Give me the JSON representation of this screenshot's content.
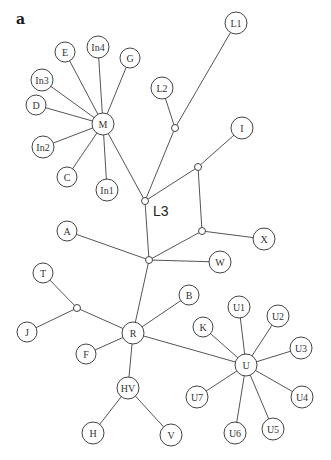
{
  "figure": {
    "panel_label": "a",
    "colors": {
      "edge": "#555555",
      "node_stroke": "#444444",
      "node_fill": "#ffffff",
      "text": "#333333"
    }
  },
  "nodes": [
    {
      "id": "M",
      "label": "M",
      "x": 103,
      "y": 124,
      "r": 11
    },
    {
      "id": "E",
      "label": "E",
      "x": 65,
      "y": 52,
      "r": 10
    },
    {
      "id": "In4",
      "label": "In4",
      "x": 98,
      "y": 47,
      "r": 11
    },
    {
      "id": "G",
      "label": "G",
      "x": 130,
      "y": 58,
      "r": 10
    },
    {
      "id": "In3",
      "label": "In3",
      "x": 42,
      "y": 80,
      "r": 11
    },
    {
      "id": "D",
      "label": "D",
      "x": 36,
      "y": 105,
      "r": 10
    },
    {
      "id": "In2",
      "label": "In2",
      "x": 43,
      "y": 147,
      "r": 11
    },
    {
      "id": "C",
      "label": "C",
      "x": 67,
      "y": 177,
      "r": 10
    },
    {
      "id": "In1",
      "label": "In1",
      "x": 107,
      "y": 190,
      "r": 11
    },
    {
      "id": "L1",
      "label": "L1",
      "x": 236,
      "y": 23,
      "r": 11
    },
    {
      "id": "L2",
      "label": "L2",
      "x": 162,
      "y": 88,
      "r": 11
    },
    {
      "id": "I",
      "label": "I",
      "x": 242,
      "y": 128,
      "r": 11
    },
    {
      "id": "A",
      "label": "A",
      "x": 67,
      "y": 231,
      "r": 10
    },
    {
      "id": "X",
      "label": "X",
      "x": 264,
      "y": 239,
      "r": 11
    },
    {
      "id": "W",
      "label": "W",
      "x": 220,
      "y": 262,
      "r": 11
    },
    {
      "id": "T",
      "label": "T",
      "x": 43,
      "y": 273,
      "r": 10
    },
    {
      "id": "B",
      "label": "B",
      "x": 189,
      "y": 295,
      "r": 10
    },
    {
      "id": "J",
      "label": "J",
      "x": 27,
      "y": 332,
      "r": 10
    },
    {
      "id": "R",
      "label": "R",
      "x": 133,
      "y": 333,
      "r": 11
    },
    {
      "id": "F",
      "label": "F",
      "x": 86,
      "y": 354,
      "r": 10
    },
    {
      "id": "HV",
      "label": "HV",
      "x": 128,
      "y": 388,
      "r": 11
    },
    {
      "id": "H",
      "label": "H",
      "x": 93,
      "y": 433,
      "r": 11
    },
    {
      "id": "V",
      "label": "V",
      "x": 171,
      "y": 435,
      "r": 11
    },
    {
      "id": "K",
      "label": "K",
      "x": 203,
      "y": 327,
      "r": 10
    },
    {
      "id": "U",
      "label": "U",
      "x": 246,
      "y": 365,
      "r": 11
    },
    {
      "id": "U1",
      "label": "U1",
      "x": 239,
      "y": 307,
      "r": 11
    },
    {
      "id": "U2",
      "label": "U2",
      "x": 278,
      "y": 316,
      "r": 11
    },
    {
      "id": "U3",
      "label": "U3",
      "x": 301,
      "y": 348,
      "r": 11
    },
    {
      "id": "U4",
      "label": "U4",
      "x": 302,
      "y": 397,
      "r": 11
    },
    {
      "id": "U5",
      "label": "U5",
      "x": 273,
      "y": 429,
      "r": 11
    },
    {
      "id": "U6",
      "label": "U6",
      "x": 235,
      "y": 433,
      "r": 11
    },
    {
      "id": "U7",
      "label": "U7",
      "x": 197,
      "y": 397,
      "r": 11
    }
  ],
  "junctions": [
    {
      "id": "jL2",
      "x": 175,
      "y": 128,
      "r": 3.5
    },
    {
      "id": "jL3",
      "x": 145,
      "y": 201,
      "r": 3.5,
      "label": "L3",
      "label_x": 153,
      "label_y": 216
    },
    {
      "id": "jI",
      "x": 198,
      "y": 167,
      "r": 3.5
    },
    {
      "id": "jX",
      "x": 202,
      "y": 231,
      "r": 3.5
    },
    {
      "id": "jC",
      "x": 149,
      "y": 260,
      "r": 3.5
    },
    {
      "id": "jT",
      "x": 77,
      "y": 308,
      "r": 3.5
    }
  ],
  "edges": [
    [
      "M",
      "E"
    ],
    [
      "M",
      "In4"
    ],
    [
      "M",
      "G"
    ],
    [
      "M",
      "In3"
    ],
    [
      "M",
      "D"
    ],
    [
      "M",
      "In2"
    ],
    [
      "M",
      "C"
    ],
    [
      "M",
      "In1"
    ],
    [
      "M",
      "jL3"
    ],
    [
      "L1",
      "jL2"
    ],
    [
      "L2",
      "jL2"
    ],
    [
      "jL2",
      "jL3"
    ],
    [
      "jL3",
      "jI"
    ],
    [
      "jI",
      "I"
    ],
    [
      "jI",
      "jX"
    ],
    [
      "jX",
      "X"
    ],
    [
      "jX",
      "jC"
    ],
    [
      "jL3",
      "jC"
    ],
    [
      "A",
      "jC"
    ],
    [
      "W",
      "jC"
    ],
    [
      "jC",
      "R"
    ],
    [
      "T",
      "jT"
    ],
    [
      "J",
      "jT"
    ],
    [
      "jT",
      "R"
    ],
    [
      "R",
      "B"
    ],
    [
      "R",
      "F"
    ],
    [
      "R",
      "HV"
    ],
    [
      "R",
      "U"
    ],
    [
      "HV",
      "H"
    ],
    [
      "HV",
      "V"
    ],
    [
      "U",
      "K"
    ],
    [
      "U",
      "U1"
    ],
    [
      "U",
      "U2"
    ],
    [
      "U",
      "U3"
    ],
    [
      "U",
      "U4"
    ],
    [
      "U",
      "U5"
    ],
    [
      "U",
      "U6"
    ],
    [
      "U",
      "U7"
    ]
  ]
}
